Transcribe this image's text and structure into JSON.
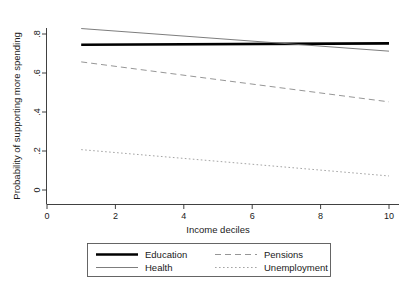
{
  "chart_data": {
    "type": "line",
    "title": "",
    "xlabel": "Income deciles",
    "ylabel": "Probability of supporting more spending",
    "xlim": [
      0,
      10.4
    ],
    "ylim": [
      0,
      0.87
    ],
    "xticks": [
      0,
      2,
      4,
      6,
      8,
      10
    ],
    "xtick_labels": [
      "0",
      "2",
      "4",
      "6",
      "8",
      "10"
    ],
    "yticks": [
      0,
      0.2,
      0.4,
      0.6,
      0.8
    ],
    "ytick_labels": [
      "0",
      ".2",
      ".4",
      ".6",
      ".8"
    ],
    "grid": false,
    "legend_position": "below-center",
    "x": [
      1,
      10
    ],
    "series": [
      {
        "name": "Education",
        "style": "thick-solid",
        "color": "#000000",
        "width": 2.6,
        "dash": "none",
        "values": [
          0.745,
          0.752
        ]
      },
      {
        "name": "Health",
        "style": "thin-solid",
        "color": "#6e6e6e",
        "width": 0.9,
        "dash": "none",
        "values": [
          0.828,
          0.712
        ]
      },
      {
        "name": "Pensions",
        "style": "dashed",
        "color": "#8a8a8a",
        "width": 0.9,
        "dash": "6 4",
        "values": [
          0.657,
          0.452
        ]
      },
      {
        "name": "Unemployment",
        "style": "dotted",
        "color": "#9a9a9a",
        "width": 0.9,
        "dash": "1.6 2.4",
        "values": [
          0.207,
          0.072
        ]
      }
    ]
  },
  "axes": {
    "y_title": "Probability of supporting more spending",
    "x_title": "Income deciles",
    "x_tick_labels": [
      "0",
      "2",
      "4",
      "6",
      "8",
      "10"
    ],
    "y_tick_labels": [
      "0",
      ".2",
      ".4",
      ".6",
      ".8"
    ]
  },
  "legend": {
    "entries": [
      {
        "label": "Education",
        "style": "thick-solid"
      },
      {
        "label": "Pensions",
        "style": "dashed"
      },
      {
        "label": "Health",
        "style": "thin-solid"
      },
      {
        "label": "Unemployment",
        "style": "dotted"
      }
    ]
  }
}
